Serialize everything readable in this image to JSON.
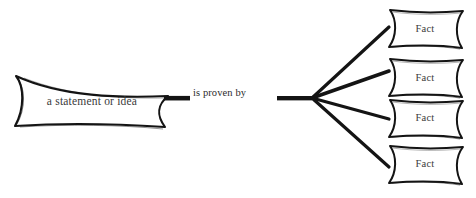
{
  "diagram": {
    "type": "concept-map",
    "style": "hand-drawn",
    "background_color": "#ffffff",
    "stroke_color": "#141414",
    "text_color": "#3a3a3a",
    "source_node": {
      "label": "a statement or idea",
      "shape": "banner-scroll"
    },
    "relation": {
      "label": "is proven by"
    },
    "target_nodes": [
      {
        "label": "Fact",
        "shape": "banner-scroll"
      },
      {
        "label": "Fact",
        "shape": "banner-scroll"
      },
      {
        "label": "Fact",
        "shape": "banner-scroll"
      },
      {
        "label": "Fact",
        "shape": "banner-scroll"
      }
    ]
  }
}
